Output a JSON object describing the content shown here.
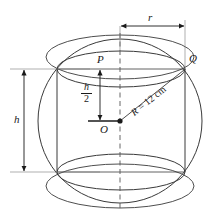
{
  "labels": {
    "point_center": "O",
    "point_top_center": "P",
    "point_rim": "Q",
    "dim_height": "h",
    "dim_radius_cyl": "r",
    "half_height_numerator": "h",
    "half_height_denominator": "2",
    "radius_symbol": "R",
    "radius_equals": " = ",
    "radius_value": "12",
    "radius_unit": " cm"
  },
  "colors": {
    "stroke": "#3a3a3a",
    "stroke_dark": "#1a1a1a",
    "background": "#ffffff",
    "text": "#1a1a1a"
  },
  "geometry": {
    "sphere_center_x": 120,
    "sphere_center_y": 121,
    "sphere_radius_px": 82,
    "cylinder_left_x": 57,
    "cylinder_right_x": 185,
    "cylinder_top_y": 69,
    "cylinder_bottom_y": 172,
    "ellipse_ry": 18,
    "radius_cm": 12
  }
}
